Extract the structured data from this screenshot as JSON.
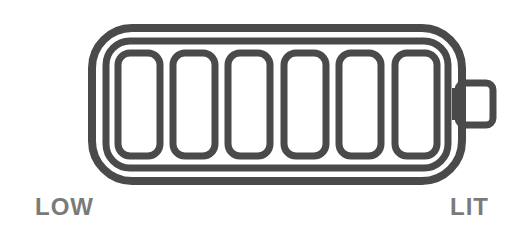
{
  "diagram": {
    "type": "battery-level-icon",
    "cell_count": 6,
    "stroke_color": "#4a4a4a",
    "label_color": "#7a7a7a",
    "labels": {
      "left": "LOW",
      "right": "LIT"
    }
  }
}
